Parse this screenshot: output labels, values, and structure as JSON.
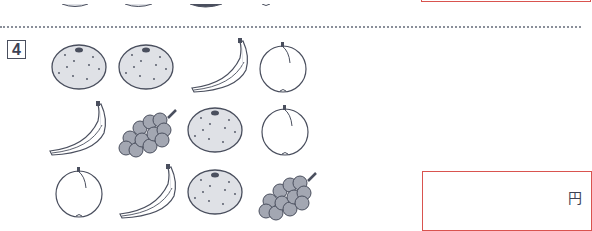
{
  "question": {
    "number": "4",
    "answer_unit": "円",
    "answer_value": ""
  },
  "fruit_grid": {
    "rows": [
      [
        "orange",
        "orange",
        "banana",
        "peach"
      ],
      [
        "banana",
        "grapes",
        "orange",
        "peach"
      ],
      [
        "peach",
        "banana",
        "orange",
        "grapes"
      ]
    ]
  },
  "colors": {
    "outline": "#4a4f5e",
    "fill_gray": "#dfe1e6",
    "grape_fill": "#a3a7b2",
    "answer_border": "#d9534f",
    "dotted_rule": "#8a8f99"
  }
}
